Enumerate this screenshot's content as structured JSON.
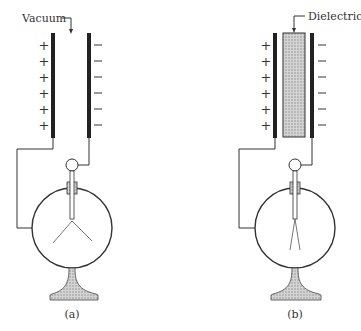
{
  "figure": {
    "panels": [
      {
        "id": "a",
        "caption": "(a)",
        "gap_label": "Vacuum",
        "left_plate_signs": [
          "+",
          "+",
          "+",
          "+",
          "+",
          "+"
        ],
        "right_plate_signs": [
          "−",
          "−",
          "−",
          "−",
          "−",
          "−"
        ],
        "leaves": "spread"
      },
      {
        "id": "b",
        "caption": "(b)",
        "gap_label": "Dielectric",
        "left_plate_signs": [
          "+",
          "+",
          "+",
          "+",
          "+",
          "+"
        ],
        "right_plate_signs": [
          "−",
          "−",
          "−",
          "−",
          "−",
          "−"
        ],
        "leaves": "nearly closed"
      }
    ],
    "colors": {
      "line": "#333333",
      "plate": "#222222",
      "hatch_fill": "#c8c8c8"
    }
  }
}
